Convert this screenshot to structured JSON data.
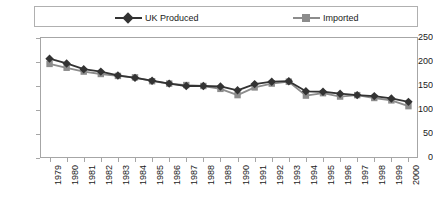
{
  "chart_data": {
    "type": "line",
    "title": "",
    "xlabel": "",
    "ylabel": "",
    "ylim": [
      0,
      250
    ],
    "ytick_step": 50,
    "yticks": [
      250,
      200,
      150,
      100,
      50,
      0
    ],
    "grid": false,
    "legend_position": "top",
    "categories": [
      "1979",
      "1980",
      "1981",
      "1982",
      "1983",
      "1984",
      "1985",
      "1986",
      "1987",
      "1988",
      "1989",
      "1990",
      "1991",
      "1992",
      "1993",
      "1994",
      "1995",
      "1996",
      "1997",
      "1998",
      "1999",
      "2000"
    ],
    "series": [
      {
        "name": "UK Produced",
        "color": "#333333",
        "marker": "diamond",
        "values": [
          207,
          197,
          185,
          180,
          172,
          167,
          161,
          155,
          150,
          150,
          149,
          141,
          154,
          159,
          160,
          139,
          138,
          134,
          131,
          129,
          124,
          117
        ]
      },
      {
        "name": "Imported",
        "color": "#8c8c8c",
        "marker": "square",
        "values": [
          196,
          188,
          180,
          175,
          171,
          168,
          160,
          155,
          152,
          150,
          144,
          131,
          147,
          155,
          159,
          130,
          135,
          128,
          131,
          125,
          120,
          108
        ]
      }
    ]
  },
  "legend": {
    "entries": [
      {
        "label": "UK Produced"
      },
      {
        "label": "Imported"
      }
    ]
  },
  "colors": {
    "uk_produced": "#333333",
    "imported": "#8c8c8c",
    "frame": "#a6a6a6",
    "legend_border": "#b0b0b0",
    "text": "#1a1a1a",
    "background": "#ffffff"
  }
}
